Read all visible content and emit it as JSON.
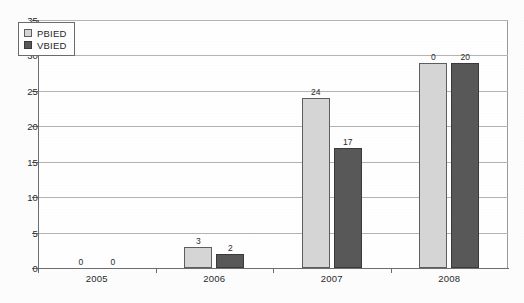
{
  "chart_data": {
    "type": "bar",
    "title": "",
    "subtitle": "",
    "xlabel": "",
    "ylabel": "",
    "categories": [
      "2005",
      "2006",
      "2007",
      "2008"
    ],
    "series": [
      {
        "name": "PBIED",
        "color": "#d6d6d6",
        "values": [
          0,
          3,
          24,
          29
        ],
        "labels": [
          "0",
          "3",
          "24",
          "0"
        ]
      },
      {
        "name": "VBIED",
        "color": "#585858",
        "values": [
          0,
          2,
          17,
          29
        ],
        "labels": [
          "0",
          "2",
          "17",
          "20"
        ]
      }
    ],
    "ylim": [
      0,
      35
    ],
    "ytick_step": 5,
    "yticks": [
      "0",
      "5",
      "10",
      "15",
      "20",
      "25",
      "30",
      "35"
    ],
    "grid": true,
    "legend_position": "top-left-inside"
  },
  "legend": {
    "entries": [
      {
        "label": "PBIED",
        "swatch": "pbied"
      },
      {
        "label": "VBIED",
        "swatch": "vbied"
      }
    ]
  }
}
